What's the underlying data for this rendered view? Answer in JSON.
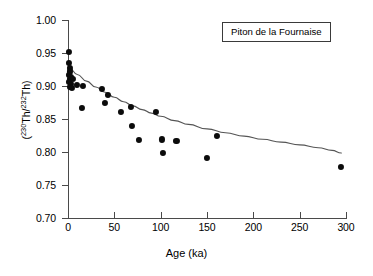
{
  "figure": {
    "background": "#ffffff",
    "point_color": "#0b0b0b",
    "axis_color": "#4a4a4a",
    "curve_color": "#555555"
  },
  "legend": {
    "label": "Piton de la Fournaise"
  },
  "axes": {
    "x_label": "Age (ka)",
    "y_label_prefix": "(",
    "y_label_sup1": "230",
    "y_label_mid1": "Th/",
    "y_label_sup2": "232",
    "y_label_mid2": "Th",
    "y_label_suffix": ")"
  },
  "chart_data": {
    "type": "scatter",
    "title": "",
    "subtitle": "",
    "xlabel": "Age (ka)",
    "ylabel": "(230Th/232Th)",
    "xlim": [
      0,
      300
    ],
    "ylim": [
      0.7,
      1.0
    ],
    "xticks": [
      0,
      50,
      100,
      150,
      200,
      250,
      300
    ],
    "xtick_labels": [
      "0",
      "50",
      "100",
      "150",
      "200",
      "250",
      "300"
    ],
    "yticks": [
      0.7,
      0.75,
      0.8,
      0.85,
      0.9,
      0.95,
      1.0
    ],
    "ytick_labels": [
      "0.70",
      "0.75",
      "0.80",
      "0.85",
      "0.90",
      "0.95",
      "1.00"
    ],
    "grid": false,
    "legend_position": "top-right",
    "legend_entries": [
      "Piton de la Fournaise"
    ],
    "annotations": [
      {
        "text": "Piton de la Fournaise",
        "x": 230,
        "y": 0.975,
        "type": "boxed-label"
      }
    ],
    "series": [
      {
        "name": "Piton de la Fournaise samples",
        "type": "scatter",
        "marker": "filled-circle",
        "color": "#0b0b0b",
        "points": [
          {
            "x": 1,
            "y": 0.952
          },
          {
            "x": 1,
            "y": 0.935
          },
          {
            "x": 2,
            "y": 0.928
          },
          {
            "x": 2,
            "y": 0.922
          },
          {
            "x": 1,
            "y": 0.917
          },
          {
            "x": 3,
            "y": 0.913
          },
          {
            "x": 2,
            "y": 0.91
          },
          {
            "x": 5,
            "y": 0.91
          },
          {
            "x": 1,
            "y": 0.906
          },
          {
            "x": 3,
            "y": 0.903
          },
          {
            "x": 2,
            "y": 0.899
          },
          {
            "x": 4,
            "y": 0.897
          },
          {
            "x": 10,
            "y": 0.901
          },
          {
            "x": 16,
            "y": 0.9
          },
          {
            "x": 15,
            "y": 0.867
          },
          {
            "x": 37,
            "y": 0.896
          },
          {
            "x": 40,
            "y": 0.874
          },
          {
            "x": 43,
            "y": 0.887
          },
          {
            "x": 57,
            "y": 0.861
          },
          {
            "x": 68,
            "y": 0.868
          },
          {
            "x": 69,
            "y": 0.84
          },
          {
            "x": 77,
            "y": 0.818
          },
          {
            "x": 95,
            "y": 0.861
          },
          {
            "x": 101,
            "y": 0.819
          },
          {
            "x": 102,
            "y": 0.799
          },
          {
            "x": 117,
            "y": 0.817
          },
          {
            "x": 150,
            "y": 0.791
          },
          {
            "x": 161,
            "y": 0.825
          },
          {
            "x": 295,
            "y": 0.778
          }
        ]
      },
      {
        "name": "fitted decay curve",
        "type": "line",
        "color": "#555555",
        "points": [
          {
            "x": 2,
            "y": 0.9265
          },
          {
            "x": 10,
            "y": 0.9175
          },
          {
            "x": 20,
            "y": 0.9075
          },
          {
            "x": 30,
            "y": 0.8985
          },
          {
            "x": 40,
            "y": 0.8905
          },
          {
            "x": 50,
            "y": 0.883
          },
          {
            "x": 60,
            "y": 0.8762
          },
          {
            "x": 70,
            "y": 0.87
          },
          {
            "x": 80,
            "y": 0.8643
          },
          {
            "x": 90,
            "y": 0.859
          },
          {
            "x": 100,
            "y": 0.8541
          },
          {
            "x": 115,
            "y": 0.8476
          },
          {
            "x": 130,
            "y": 0.8418
          },
          {
            "x": 150,
            "y": 0.835
          },
          {
            "x": 170,
            "y": 0.8292
          },
          {
            "x": 190,
            "y": 0.824
          },
          {
            "x": 210,
            "y": 0.8193
          },
          {
            "x": 230,
            "y": 0.815
          },
          {
            "x": 250,
            "y": 0.8108
          },
          {
            "x": 270,
            "y": 0.8064
          },
          {
            "x": 285,
            "y": 0.8025
          },
          {
            "x": 295,
            "y": 0.7985
          }
        ]
      }
    ]
  }
}
